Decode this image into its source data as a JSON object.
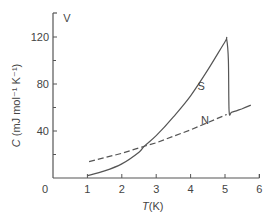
{
  "chart_data": {
    "type": "line",
    "title": "",
    "xlabel": "T(K)",
    "xlabel_italic_part": "T",
    "xlabel_unit": "(K)",
    "ylabel": "C (mJ mol⁻¹ K⁻¹)",
    "ylabel_italic_part": "C",
    "ylabel_unit": " (mJ mol⁻¹ K⁻¹)",
    "xlim": [
      0,
      6
    ],
    "ylim": [
      0,
      140
    ],
    "xticks": [
      "0",
      "1",
      "2",
      "3",
      "4",
      "5",
      "6"
    ],
    "yticks": [
      "40",
      "80",
      "120"
    ],
    "y_minor_ticks": [
      20,
      60,
      100
    ],
    "grid": false,
    "legend": "none",
    "annotations": [
      {
        "text": "V",
        "x": 0.3,
        "y": 133
      },
      {
        "text": "S",
        "x": 4.2,
        "y": 75
      },
      {
        "text": "N",
        "x": 4.3,
        "y": 46
      }
    ],
    "series": [
      {
        "name": "S",
        "style": "solid",
        "x": [
          1.0,
          1.5,
          2.0,
          2.5,
          2.65,
          3.0,
          3.5,
          4.0,
          4.5,
          5.0,
          5.05,
          5.1,
          5.12,
          5.2,
          5.5,
          5.75
        ],
        "values": [
          2,
          6,
          12,
          22,
          27,
          36,
          52,
          70,
          92,
          116,
          118,
          100,
          57,
          56,
          59,
          62
        ]
      },
      {
        "name": "N",
        "style": "dashed",
        "x": [
          1.05,
          2.0,
          2.65,
          3.0,
          4.0,
          5.05
        ],
        "values": [
          14,
          21,
          27,
          30,
          41,
          54
        ]
      }
    ]
  }
}
